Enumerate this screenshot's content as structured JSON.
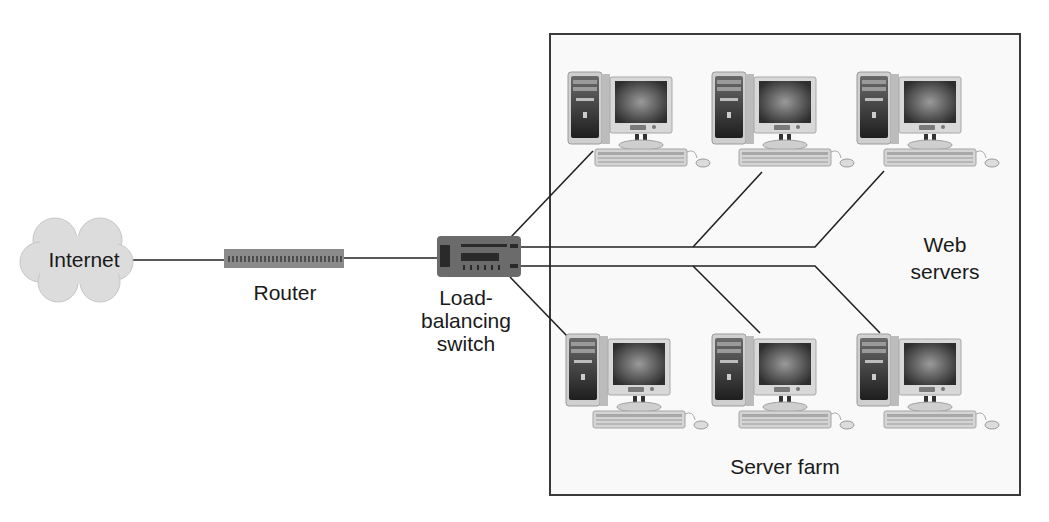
{
  "diagram": {
    "nodes": {
      "internet": {
        "label": "Internet",
        "icon": "cloud-icon"
      },
      "router": {
        "label": "Router",
        "icon": "router-icon"
      },
      "switch": {
        "label_line1": "Load-",
        "label_line2": "balancing",
        "label_line3": "switch",
        "icon": "switch-icon"
      },
      "server_farm": {
        "label": "Server farm"
      },
      "web_servers": {
        "label_line1": "Web",
        "label_line2": "servers"
      }
    },
    "servers": [
      {
        "id": "server-1",
        "row": "top",
        "icon": "computer-icon"
      },
      {
        "id": "server-2",
        "row": "top",
        "icon": "computer-icon"
      },
      {
        "id": "server-3",
        "row": "top",
        "icon": "computer-icon"
      },
      {
        "id": "server-4",
        "row": "bottom",
        "icon": "computer-icon"
      },
      {
        "id": "server-5",
        "row": "bottom",
        "icon": "computer-icon"
      },
      {
        "id": "server-6",
        "row": "bottom",
        "icon": "computer-icon"
      }
    ],
    "connections": [
      {
        "from": "internet",
        "to": "router"
      },
      {
        "from": "router",
        "to": "switch"
      },
      {
        "from": "switch",
        "to": "server-1"
      },
      {
        "from": "switch",
        "to": "server-2"
      },
      {
        "from": "switch",
        "to": "server-3"
      },
      {
        "from": "switch",
        "to": "server-4"
      },
      {
        "from": "switch",
        "to": "server-5"
      },
      {
        "from": "switch",
        "to": "server-6"
      }
    ],
    "colors": {
      "line": "#222222",
      "cloud": "#dcdcdc",
      "router": "#8a8a8a",
      "switch": "#6b6b6b",
      "box_border": "#3a3a3a",
      "screen": "#4a4a4a"
    }
  }
}
